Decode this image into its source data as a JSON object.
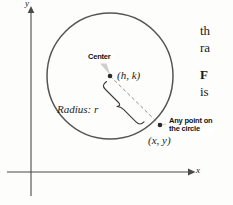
{
  "figure": {
    "type": "geometry-diagram",
    "background_color": "#fdfdfb",
    "ink_color": "#3a3a3a",
    "pointer_color": "#c9c9c9"
  },
  "axes": {
    "x_label": "x",
    "y_label": "y",
    "x_axis": {
      "from_x": 7,
      "to_x": 190,
      "y": 172,
      "arrow": true
    },
    "y_axis": {
      "x": 31,
      "from_y": 196,
      "to_y": 10,
      "arrow": true
    }
  },
  "circle": {
    "center_x": 110,
    "center_y": 76,
    "radius": 63,
    "stroke_color": "#555555",
    "stroke_width": 1.4
  },
  "points": {
    "center_point": {
      "x": 110,
      "y": 76,
      "label": "(h, k)"
    },
    "circle_point": {
      "x": 160,
      "y": 125,
      "label": "(x, y)"
    }
  },
  "radius_segment": {
    "label": "Radius: r",
    "style": "dashed",
    "brace": true
  },
  "callouts": [
    {
      "name": "center-callout",
      "text": "Center",
      "points_to": "center_point"
    },
    {
      "name": "any-point-callout",
      "line1": "Any point on",
      "line2": "the circle",
      "points_to": "circle_point"
    }
  ],
  "body_text": {
    "fragment_1_line_1": "th",
    "fragment_1_line_2": "ra",
    "fragment_2_bold": "F",
    "fragment_2_line_2": "is"
  }
}
